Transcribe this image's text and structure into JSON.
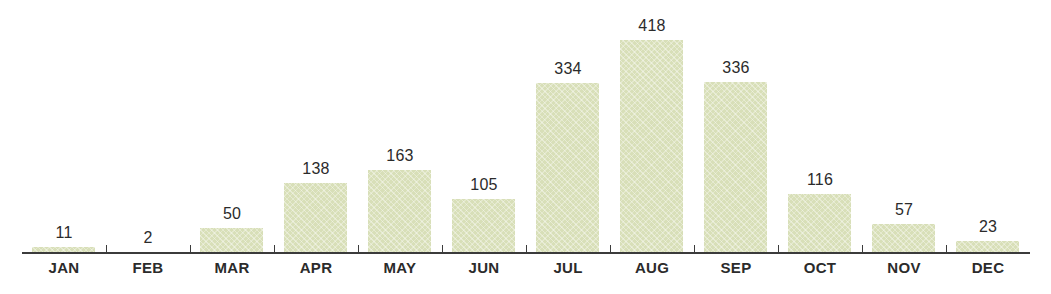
{
  "chart_data": {
    "type": "bar",
    "title": "",
    "subtitle": "",
    "xlabel": "",
    "ylabel": "",
    "categories": [
      "JAN",
      "FEB",
      "MAR",
      "APR",
      "MAY",
      "JUN",
      "JUL",
      "AUG",
      "SEP",
      "OCT",
      "NOV",
      "DEC"
    ],
    "values": [
      11,
      2,
      50,
      138,
      163,
      105,
      334,
      418,
      336,
      116,
      57,
      23
    ],
    "value_labels": [
      "11",
      "2",
      "50",
      "138",
      "163",
      "105",
      "334",
      "418",
      "336",
      "116",
      "57",
      "23"
    ],
    "ylim": [
      0,
      418
    ],
    "grid": false,
    "legend": null,
    "annotations": [],
    "series": [
      {
        "name": "",
        "values": [
          11,
          2,
          50,
          138,
          163,
          105,
          334,
          418,
          336,
          116,
          57,
          23
        ]
      }
    ],
    "style": {
      "bar_color": "#d8dfb8",
      "axis_color": "#3b3b3b",
      "text_color": "#2b2b2b",
      "background": "#ffffff",
      "bar_texture": "diagonal-crosshatch"
    }
  }
}
